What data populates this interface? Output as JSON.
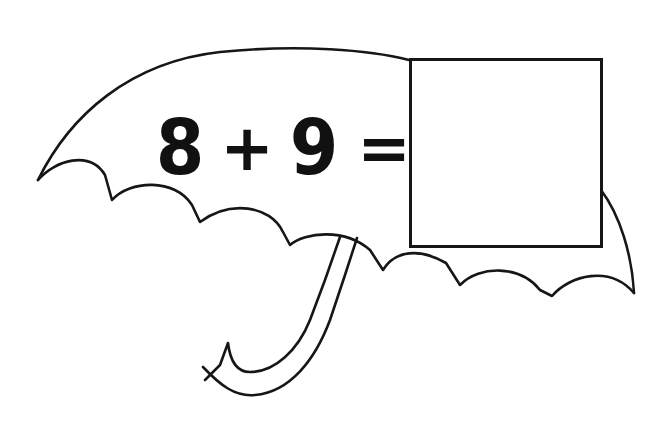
{
  "worksheet": {
    "equation": {
      "operand_a": "8",
      "operator": "+",
      "operand_b": "9",
      "equals": "=",
      "answer": ""
    },
    "illustration": "umbrella-icon",
    "colors": {
      "ink": "#111111",
      "background": "#ffffff"
    }
  }
}
